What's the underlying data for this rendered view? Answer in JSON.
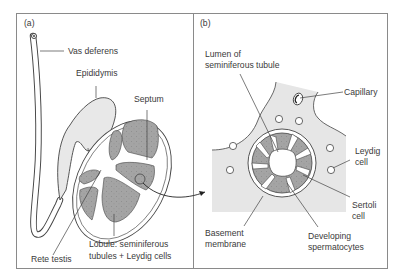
{
  "figure": {
    "panels": [
      {
        "id": "a",
        "label": "(a)",
        "labels": {
          "vas_deferens": "Vas deferens",
          "epididymis": "Epididymis",
          "septum": "Septum",
          "rete_testis": "Rete testis",
          "lobule_line1": "Lobule: seminiferous",
          "lobule_line2": "tubules + Leydig cells"
        }
      },
      {
        "id": "b",
        "label": "(b)",
        "labels": {
          "lumen_line1": "Lumen of",
          "lumen_line2": "seminiferous tubule",
          "capillary": "Capillary",
          "leydig_line1": "Leydig",
          "leydig_line2": "cell",
          "sertoli_line1": "Sertoli",
          "sertoli_line2": "cell",
          "basement_line1": "Basement",
          "basement_line2": "membrane",
          "developing_line1": "Developing",
          "developing_line2": "spermatocytes"
        }
      }
    ],
    "colors": {
      "frame": "#8a8a8a",
      "tissue_fill": "#e6e6e6",
      "lobule_fill": "#9c9c9c",
      "line": "#3a3a3a"
    }
  }
}
